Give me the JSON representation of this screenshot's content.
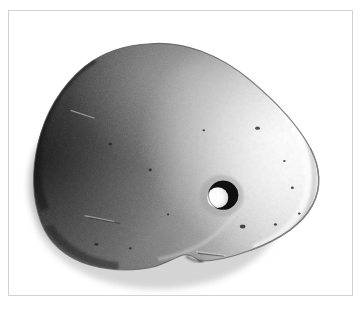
{
  "image": {
    "kind": "photograph",
    "subject": "perforated stone artifact",
    "description": "Black and white photograph of a flat ovoid stone pebble with a single drilled perforation right of centre",
    "orientation": "horizontal",
    "background_color": "#ffffff",
    "frame_color": "#d2d2d2",
    "has_frame": true,
    "caption_text": ""
  },
  "artifact": {
    "name": "perforated stone",
    "shape": "asymmetric ovoid / teardrop",
    "surface_texture": "granular, pitted",
    "lighting": "lit from upper right, shadowed on left",
    "tone_dark": "#3a3a3a",
    "tone_mid": "#8e8e8e",
    "tone_light": "#f2f2f2",
    "rim_shadow_color": "#1b1b1b",
    "bounds_px": {
      "left": 33,
      "top": 42,
      "right": 323,
      "bottom": 271
    },
    "perforation": {
      "name": "drilled hole",
      "center_px": {
        "x": 222,
        "y": 196
      },
      "outer_radius_px": 15,
      "bore_fill": "#ffffff",
      "bore_shadow": "#101010",
      "count": 1
    },
    "notch": {
      "name": "basal notch",
      "position_px": {
        "x": 200,
        "y": 262
      },
      "description": "slight concave dip along the lower edge"
    },
    "pits": [
      {
        "x": 258,
        "y": 128,
        "r": 2.2
      },
      {
        "x": 243,
        "y": 227,
        "r": 2.6
      },
      {
        "x": 110,
        "y": 144,
        "r": 1.8
      },
      {
        "x": 150,
        "y": 170,
        "r": 1.6
      },
      {
        "x": 293,
        "y": 188,
        "r": 1.4
      },
      {
        "x": 300,
        "y": 214,
        "r": 1.3
      },
      {
        "x": 276,
        "y": 225,
        "r": 1.5
      },
      {
        "x": 285,
        "y": 161,
        "r": 1.2
      },
      {
        "x": 96,
        "y": 245,
        "r": 1.8
      },
      {
        "x": 130,
        "y": 249,
        "r": 1.4
      }
    ],
    "scratches": [
      {
        "x1": 70,
        "y1": 110,
        "x2": 92,
        "y2": 118
      },
      {
        "x1": 84,
        "y1": 216,
        "x2": 112,
        "y2": 221
      },
      {
        "x1": 196,
        "y1": 252,
        "x2": 224,
        "y2": 255
      }
    ]
  }
}
